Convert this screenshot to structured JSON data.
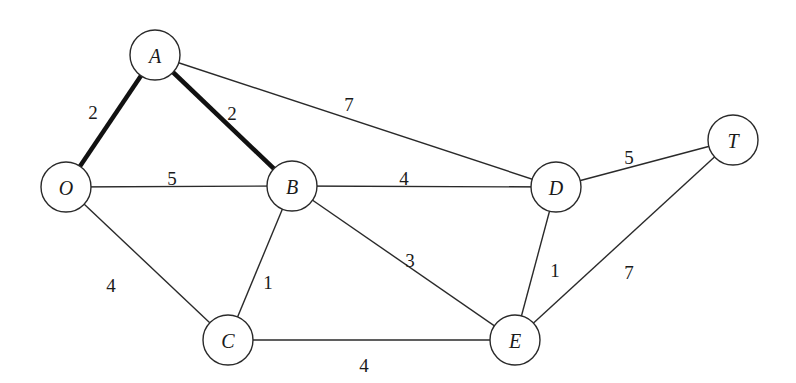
{
  "diagram": {
    "type": "weighted-undirected-graph",
    "node_radius": 25,
    "colors": {
      "stroke": "#2a2a2a",
      "highlight": "#111111",
      "fill": "#ffffff",
      "text": "#1a1a1a"
    },
    "nodes": [
      {
        "id": "A",
        "label": "A",
        "x": 155,
        "y": 55
      },
      {
        "id": "O",
        "label": "O",
        "x": 66,
        "y": 187
      },
      {
        "id": "B",
        "label": "B",
        "x": 292,
        "y": 186
      },
      {
        "id": "D",
        "label": "D",
        "x": 556,
        "y": 187
      },
      {
        "id": "T",
        "label": "T",
        "x": 733,
        "y": 140
      },
      {
        "id": "C",
        "label": "C",
        "x": 228,
        "y": 340
      },
      {
        "id": "E",
        "label": "E",
        "x": 515,
        "y": 340
      }
    ],
    "edges": [
      {
        "from": "O",
        "to": "A",
        "weight": "2",
        "highlighted": true,
        "lx": 93,
        "ly": 112
      },
      {
        "from": "A",
        "to": "B",
        "weight": "2",
        "highlighted": true,
        "lx": 232,
        "ly": 113
      },
      {
        "from": "A",
        "to": "D",
        "weight": "7",
        "highlighted": false,
        "lx": 349,
        "ly": 104
      },
      {
        "from": "O",
        "to": "B",
        "weight": "5",
        "highlighted": false,
        "lx": 172,
        "ly": 178
      },
      {
        "from": "B",
        "to": "D",
        "weight": "4",
        "highlighted": false,
        "lx": 404,
        "ly": 178
      },
      {
        "from": "D",
        "to": "T",
        "weight": "5",
        "highlighted": false,
        "lx": 629,
        "ly": 157
      },
      {
        "from": "O",
        "to": "C",
        "weight": "4",
        "highlighted": false,
        "lx": 111,
        "ly": 285
      },
      {
        "from": "B",
        "to": "C",
        "weight": "1",
        "highlighted": false,
        "lx": 268,
        "ly": 282
      },
      {
        "from": "B",
        "to": "E",
        "weight": "3",
        "highlighted": false,
        "lx": 410,
        "ly": 260
      },
      {
        "from": "D",
        "to": "E",
        "weight": "1",
        "highlighted": false,
        "lx": 555,
        "ly": 270
      },
      {
        "from": "T",
        "to": "E",
        "weight": "7",
        "highlighted": false,
        "lx": 629,
        "ly": 272
      },
      {
        "from": "C",
        "to": "E",
        "weight": "4",
        "highlighted": false,
        "lx": 364,
        "ly": 365
      }
    ]
  }
}
